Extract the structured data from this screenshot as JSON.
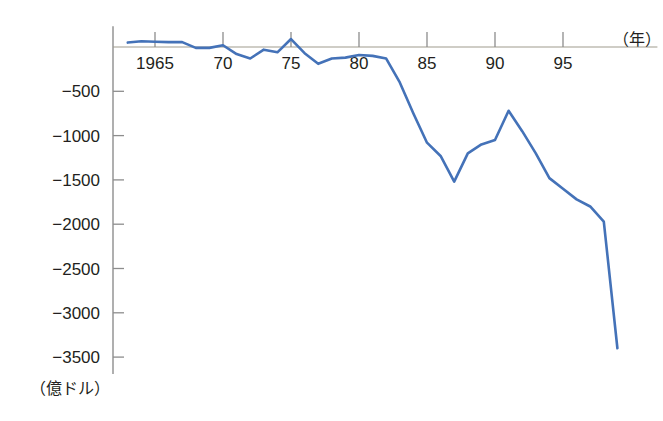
{
  "chart_data": {
    "type": "line",
    "title": "",
    "subtitle": "",
    "xlabel": "（年）",
    "ylabel": "（億ドル）",
    "xlim": [
      1963,
      1999
    ],
    "ylim": [
      -3600,
      120
    ],
    "grid": false,
    "legend": "none",
    "legend_entries": [],
    "annotations": [],
    "line_color": "#4472b8",
    "axis_color": "#8d8d8d",
    "zero_line_color": "#a09c8e",
    "x_tick_labels": [
      "1965",
      "70",
      "75",
      "80",
      "85",
      "90",
      "95"
    ],
    "x_tick_values": [
      1965,
      1970,
      1975,
      1980,
      1985,
      1990,
      1995
    ],
    "y_tick_labels": [
      "−500",
      "−1000",
      "−1500",
      "−2000",
      "−2500",
      "−3000",
      "−3500"
    ],
    "y_tick_values": [
      -500,
      -1000,
      -1500,
      -2000,
      -2500,
      -3000,
      -3500
    ],
    "series": [
      {
        "name": "貿易収支",
        "x": [
          1963,
          1964,
          1965,
          1966,
          1967,
          1968,
          1969,
          1970,
          1971,
          1972,
          1973,
          1974,
          1975,
          1976,
          1977,
          1978,
          1979,
          1980,
          1981,
          1982,
          1983,
          1984,
          1985,
          1986,
          1987,
          1988,
          1989,
          1990,
          1991,
          1992,
          1993,
          1994,
          1995,
          1996,
          1997,
          1998,
          1999
        ],
        "values": [
          50,
          65,
          60,
          55,
          55,
          -10,
          -10,
          20,
          -80,
          -130,
          -30,
          -60,
          90,
          -70,
          -190,
          -130,
          -120,
          -90,
          -100,
          -130,
          -400,
          -750,
          -1080,
          -1230,
          -1520,
          -1200,
          -1100,
          -1050,
          -720,
          -950,
          -1200,
          -1480,
          -1600,
          -1720,
          -1800,
          -1970,
          -3400
        ]
      }
    ]
  }
}
